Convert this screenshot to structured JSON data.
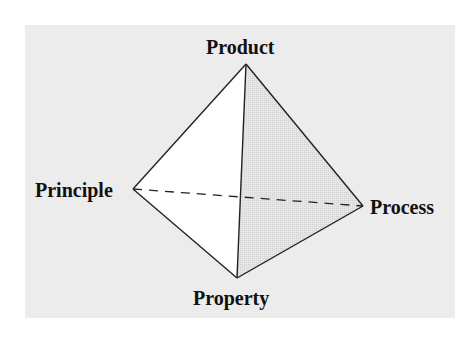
{
  "diagram": {
    "type": "tetrahedron",
    "vertices": {
      "top": "Product",
      "left": "Principle",
      "right": "Process",
      "bottom": "Property"
    },
    "edges": [
      {
        "from": "Product",
        "to": "Principle",
        "style": "solid"
      },
      {
        "from": "Product",
        "to": "Process",
        "style": "solid"
      },
      {
        "from": "Product",
        "to": "Property",
        "style": "solid"
      },
      {
        "from": "Principle",
        "to": "Property",
        "style": "solid"
      },
      {
        "from": "Process",
        "to": "Property",
        "style": "solid"
      },
      {
        "from": "Principle",
        "to": "Process",
        "style": "dashed"
      }
    ],
    "colors": {
      "background": "#ececec",
      "front_face": "#ffffff",
      "shaded_face": "#e4e4e4",
      "lines": "#222222"
    }
  }
}
